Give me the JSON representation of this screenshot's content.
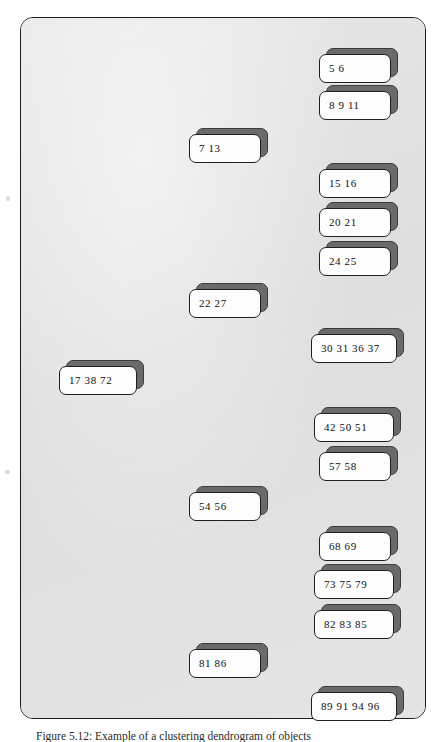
{
  "figure": {
    "caption": "Figure 5.12: Example of a clustering dendrogram of objects",
    "frame": {
      "fill_color": "#e2e2e2",
      "border_color": "#1c1c1c"
    },
    "node_style": {
      "face_color": "#fdfdfd",
      "block_color": "#6a6a6a",
      "text_color": "#101010"
    }
  },
  "nodes": [
    {
      "label": "5  6",
      "x": 318,
      "y": 53,
      "width": 72,
      "level": 3
    },
    {
      "label": "8  9  11",
      "x": 318,
      "y": 90,
      "width": 72,
      "level": 3
    },
    {
      "label": "7   13",
      "x": 188,
      "y": 133,
      "width": 72,
      "level": 2
    },
    {
      "label": "15  16",
      "x": 318,
      "y": 168,
      "width": 72,
      "level": 3
    },
    {
      "label": "20  21",
      "x": 318,
      "y": 207,
      "width": 72,
      "level": 3
    },
    {
      "label": "24  25",
      "x": 318,
      "y": 246,
      "width": 72,
      "level": 3
    },
    {
      "label": "22  27",
      "x": 188,
      "y": 288,
      "width": 72,
      "level": 2
    },
    {
      "label": "30  31  36  37",
      "x": 310,
      "y": 333,
      "width": 86,
      "level": 3
    },
    {
      "label": "17  38  72",
      "x": 58,
      "y": 365,
      "width": 78,
      "level": 1
    },
    {
      "label": "42  50  51",
      "x": 313,
      "y": 412,
      "width": 80,
      "level": 3
    },
    {
      "label": "57  58",
      "x": 318,
      "y": 451,
      "width": 72,
      "level": 3
    },
    {
      "label": "54  56",
      "x": 188,
      "y": 491,
      "width": 72,
      "level": 2
    },
    {
      "label": "68  69",
      "x": 318,
      "y": 531,
      "width": 72,
      "level": 3
    },
    {
      "label": "73  75  79",
      "x": 313,
      "y": 569,
      "width": 80,
      "level": 3
    },
    {
      "label": "82  83  85",
      "x": 313,
      "y": 609,
      "width": 80,
      "level": 3
    },
    {
      "label": "81  86",
      "x": 188,
      "y": 648,
      "width": 72,
      "level": 2
    },
    {
      "label": "89  91  94  96",
      "x": 310,
      "y": 691,
      "width": 86,
      "level": 3
    }
  ]
}
